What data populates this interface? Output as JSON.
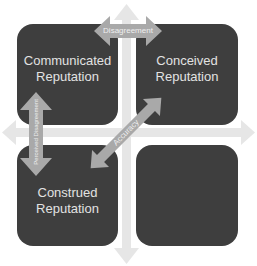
{
  "quadrants": {
    "top_left": {
      "line1": "Communicated",
      "line2": "Reputation"
    },
    "top_right": {
      "line1": "Conceived",
      "line2": "Reputation"
    },
    "bottom_left": {
      "line1": "Construed",
      "line2": "Reputation"
    },
    "bottom_right": {
      "line1": "",
      "line2": ""
    }
  },
  "arrows": {
    "horizontal_top": "Disagreement",
    "vertical_left": "Perceived Disagreement",
    "diagonal": "Accuracy"
  },
  "colors": {
    "box": "#3e3e3e",
    "box_text": "#e2e2e2",
    "axis": "#e6e6e6",
    "arrow": "#a9a9a9"
  },
  "icons": {
    "axis_vertical": "double-vertical-axis-arrow",
    "axis_horizontal": "double-horizontal-axis-arrow",
    "disagreement_arrow": "double-headed-horizontal-arrow",
    "perceived_disagreement_arrow": "double-headed-vertical-arrow",
    "accuracy_arrow": "double-headed-diagonal-arrow"
  }
}
